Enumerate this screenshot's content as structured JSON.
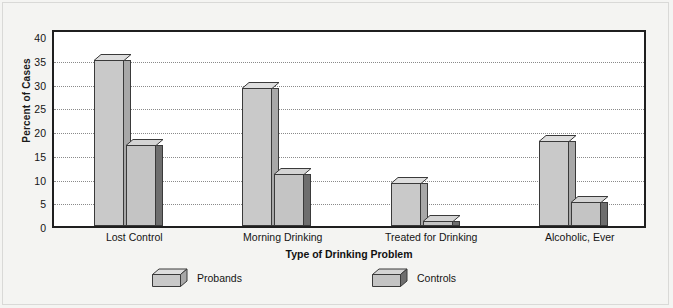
{
  "chart_data": {
    "type": "bar",
    "title": "",
    "xlabel": "Type of Drinking Problem",
    "ylabel": "Percent of Cases",
    "categories": [
      "Lost Control",
      "Morning Drinking",
      "Treated for Drinking",
      "Alcoholic, Ever"
    ],
    "series": [
      {
        "name": "Probands",
        "values": [
          35,
          29,
          9,
          18
        ],
        "color": "#c9c9c9"
      },
      {
        "name": "Controls",
        "values": [
          17,
          11,
          1,
          5
        ],
        "color": "#c4c4c4"
      }
    ],
    "ylim": [
      0,
      40
    ],
    "yticks": [
      0,
      5,
      10,
      15,
      20,
      25,
      30,
      35,
      40
    ],
    "ytick_labels": [
      "0",
      "5",
      "10",
      "15",
      "20",
      "25",
      "30",
      "35",
      "40"
    ],
    "grid": true,
    "grid_style": "dotted-horizontal",
    "legend_position": "bottom",
    "style": "3d-bars",
    "background": "#f4f4f2",
    "plot_background": "#ffffff",
    "axis_color": "#1f1f1f"
  },
  "axes": {
    "y_title": "Percent of Cases",
    "x_title": "Type of Drinking Problem"
  },
  "legend": {
    "items": [
      {
        "label": "Probands"
      },
      {
        "label": "Controls"
      }
    ]
  }
}
